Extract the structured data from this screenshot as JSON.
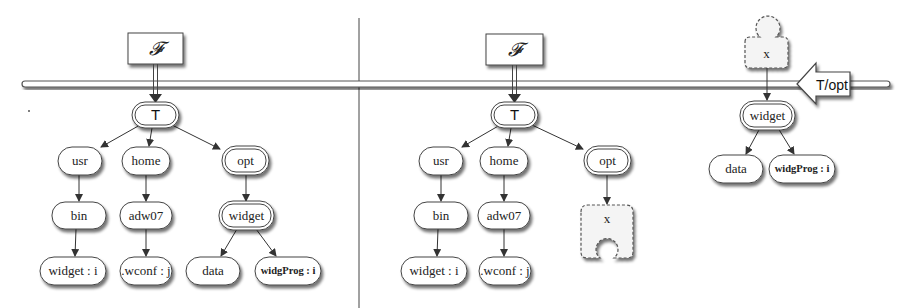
{
  "diagram": {
    "divider": {
      "x": 359
    },
    "rail": {
      "y": 84,
      "x1": 22,
      "x2": 890
    },
    "left": {
      "F_label": "𝓕",
      "root": "T",
      "nodes": {
        "usr": "usr",
        "home": "home",
        "opt": "opt",
        "bin": "bin",
        "adw07": "adw07",
        "widget": "widget",
        "widget_i": "widget : i",
        "wconf_j": ".wconf : j",
        "data": "data",
        "widgProg_i": "widgProg : i"
      }
    },
    "right": {
      "F_label": "𝓕",
      "root": "T",
      "nodes": {
        "usr": "usr",
        "home": "home",
        "opt": "opt",
        "bin": "bin",
        "adw07": "adw07",
        "hole": "x",
        "widget_i": "widget : i",
        "wconf_j": ".wconf : j"
      },
      "subtree": {
        "hole_top": "x",
        "arrow_label": "T/opt",
        "widget": "widget",
        "data": "data",
        "widgProg_i": "widgProg : i"
      }
    },
    "colors": {
      "stroke": "#333333",
      "shadow": "#9a9a9a",
      "fill": "#ffffff"
    }
  }
}
